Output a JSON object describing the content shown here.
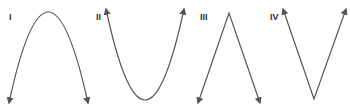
{
  "graphs": [
    {
      "label": "I",
      "shape": "downward-opening parabola with arrows pointing down at both ends"
    },
    {
      "label": "II",
      "shape": "upward-opening parabola with arrows pointing up at both ends"
    },
    {
      "label": "III",
      "shape": "inverted V (absolute-value-like) with arrows pointing down"
    },
    {
      "label": "IV",
      "shape": "V shape (absolute-value) with arrows pointing up"
    }
  ],
  "colors": {
    "stroke": "#555555",
    "label": "#333333",
    "background": "#ffffff"
  }
}
